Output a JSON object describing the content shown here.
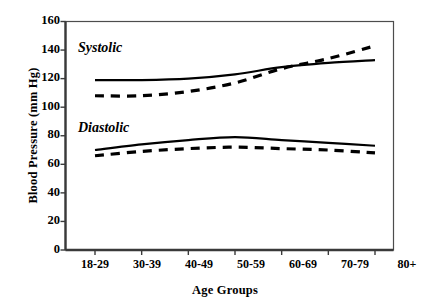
{
  "chart_data": {
    "type": "line",
    "title": "",
    "xlabel": "Age Groups",
    "ylabel": "Blood Pressure (mm Hg)",
    "categories": [
      "18-29",
      "30-39",
      "40-49",
      "50-59",
      "60-69",
      "70-79",
      "80+"
    ],
    "ylim": [
      0,
      160
    ],
    "yticks": [
      0,
      20,
      40,
      60,
      80,
      100,
      120,
      140,
      160
    ],
    "grid": false,
    "legend_position": "inline-annotation",
    "annotations": [
      "Systolic",
      "Diastolic"
    ],
    "series": [
      {
        "name": "Systolic solid",
        "group": "Systolic",
        "style": "solid",
        "color": "#000000",
        "values": [
          119,
          119,
          120,
          123,
          128,
          131,
          133
        ]
      },
      {
        "name": "Systolic dashed",
        "group": "Systolic",
        "style": "dashed",
        "color": "#000000",
        "values": [
          108,
          108,
          111,
          117,
          127,
          134,
          143
        ]
      },
      {
        "name": "Diastolic solid",
        "group": "Diastolic",
        "style": "solid",
        "color": "#000000",
        "values": [
          70,
          74,
          77,
          79,
          77,
          75,
          73
        ]
      },
      {
        "name": "Diastolic dashed",
        "group": "Diastolic",
        "style": "dashed",
        "color": "#000000",
        "values": [
          66,
          69,
          71,
          72,
          71,
          70,
          68
        ]
      }
    ]
  },
  "axes": {
    "y_title": "Blood Pressure (mm Hg)",
    "x_title": "Age Groups",
    "y_tick_labels": [
      "160",
      "140",
      "120",
      "100",
      "80",
      "60",
      "40",
      "20",
      "0"
    ],
    "x_tick_labels": [
      "18-29",
      "30-39",
      "40-49",
      "50-59",
      "60-69",
      "70-79",
      "80+"
    ]
  },
  "annotations": {
    "systolic": "Systolic",
    "diastolic": "Diastolic"
  },
  "colors": {
    "line": "#000000",
    "axis": "#4d4d4d",
    "background": "#ffffff"
  }
}
